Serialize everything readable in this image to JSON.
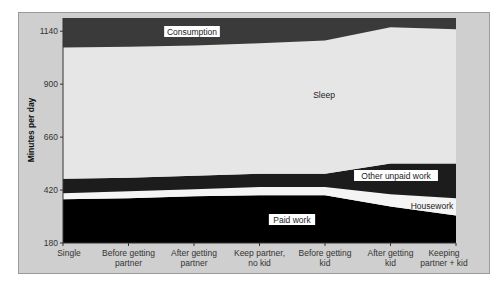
{
  "chart_data": {
    "type": "area",
    "stacked": true,
    "title": "",
    "xlabel": "",
    "ylabel": "Minutes per day",
    "ylim": [
      180,
      1200
    ],
    "yticks": [
      180,
      420,
      660,
      900,
      1140
    ],
    "categories": [
      "Single",
      "Before getting partner",
      "After getting partner",
      "Keep partner, no kid",
      "Before getting kid",
      "After getting kid",
      "Keeping partner + kid"
    ],
    "category_labels": [
      [
        "Single"
      ],
      [
        "Before getting",
        "partner"
      ],
      [
        "After getting",
        "partner"
      ],
      [
        "Keep partner,",
        "no kid"
      ],
      [
        "Before getting",
        "kid"
      ],
      [
        "After getting",
        "kid"
      ],
      [
        "Keeping",
        "partner + kid"
      ]
    ],
    "baseline": 180,
    "series": [
      {
        "name": "Paid work",
        "color": "#000000",
        "values": [
          198,
          203,
          212,
          217,
          217,
          166,
          125
        ]
      },
      {
        "name": "Housework",
        "color": "#f4f4f4",
        "values": [
          28,
          32,
          32,
          37,
          37,
          55,
          78
        ]
      },
      {
        "name": "Other unpaid work",
        "color": "#1c1c1c",
        "values": [
          65,
          61,
          61,
          60,
          60,
          139,
          157
        ]
      },
      {
        "name": "Sleep",
        "color": "#e6e6e6",
        "values": [
          595,
          594,
          590,
          591,
          604,
          618,
          609
        ]
      },
      {
        "name": "Consumption",
        "color": "#3a3a3a",
        "values": [
          134,
          130,
          125,
          115,
          102,
          42,
          51
        ]
      }
    ],
    "band_labels": [
      {
        "series": "Consumption",
        "x": 192,
        "y": 33
      },
      {
        "series": "Sleep",
        "x": 324,
        "y": 96
      },
      {
        "series": "Other unpaid work",
        "x": 396,
        "y": 177
      },
      {
        "series": "Housework",
        "x": 432,
        "y": 207
      },
      {
        "series": "Paid work",
        "x": 292,
        "y": 221
      }
    ],
    "grid": false,
    "legend": "inline labels"
  }
}
